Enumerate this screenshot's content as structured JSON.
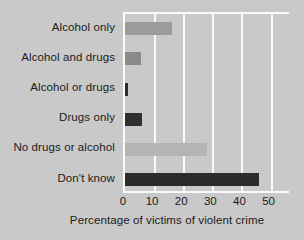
{
  "chart_data": {
    "type": "bar",
    "orientation": "horizontal",
    "title": "",
    "xlabel": "Percentage of victims of violent crime",
    "ylabel": "",
    "categories": [
      "Alcohol only",
      "Alcohol and drugs",
      "Alcohol or drugs",
      "Drugs only",
      "No drugs or alcohol",
      "Don't know"
    ],
    "values": [
      16,
      5.5,
      1,
      6,
      28,
      46
    ],
    "bar_colors": [
      "#9b9b9b",
      "#8a8a8a",
      "#2c2c2c",
      "#2f2f2f",
      "#b4b4b4",
      "#2b2b2b"
    ],
    "xlim": [
      0,
      57
    ],
    "xticks": [
      0,
      10,
      20,
      30,
      40,
      50
    ],
    "xtick_labels": [
      "0",
      "10",
      "20",
      "30",
      "40",
      "50"
    ],
    "grid": "vertical-white",
    "legend": "none",
    "background_color": "#c9c9c9",
    "gridline_color": "#fbfbfb",
    "text_color": "#1b1b1b"
  }
}
